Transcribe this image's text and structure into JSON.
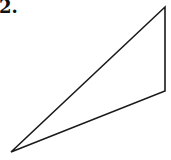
{
  "problem": {
    "number_label": "2."
  },
  "figure": {
    "shape": "triangle",
    "stroke_color": "#1a1a1a",
    "stroke_width": 1.6,
    "fill": "none",
    "vertices": {
      "top_right": [
        165,
        7
      ],
      "bottom_right": [
        165,
        91
      ],
      "bottom_left": [
        11,
        152
      ]
    },
    "points": "165,7 165,91 11,152"
  }
}
